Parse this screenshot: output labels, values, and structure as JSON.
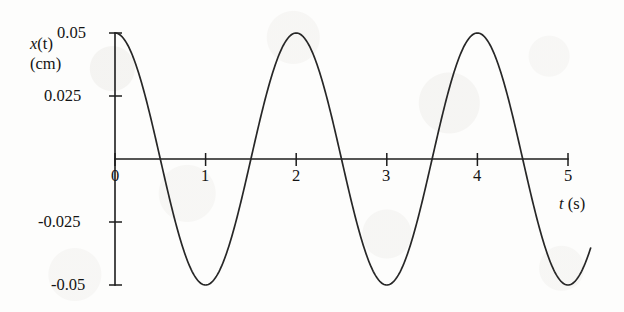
{
  "figure": {
    "background_color": "#fdfdfc",
    "ink_color": "#1c1c1c"
  },
  "axes": {
    "y_axis_label_line1_var": "x",
    "y_axis_label_line1_arg": "(t)",
    "y_axis_label_line2": "(cm)",
    "x_axis_label_var": "t",
    "x_axis_label_unit": "(s)"
  },
  "chart_data": {
    "type": "line",
    "title": "",
    "subtitle": "",
    "xlabel": "t (s)",
    "ylabel": "x(t) (cm)",
    "xlim": [
      0,
      5.25
    ],
    "ylim": [
      -0.05,
      0.05
    ],
    "grid": false,
    "legend": null,
    "x_ticks": [
      0,
      1,
      2,
      3,
      4,
      5
    ],
    "x_tick_labels": [
      "0",
      "1",
      "2",
      "3",
      "4",
      "5"
    ],
    "y_ticks": [
      0.05,
      0.025,
      -0.025,
      -0.05
    ],
    "y_tick_labels": [
      "0.05",
      "0.025",
      "-0.025",
      "-0.05"
    ],
    "function": "x(t) = 0.05 cos(pi t)",
    "amplitude": 0.05,
    "period": 2,
    "units": "cm",
    "series": [
      {
        "name": "x(t)",
        "color": "#272727",
        "x": [
          0,
          0.1,
          0.2,
          0.3,
          0.4,
          0.5,
          0.6,
          0.7,
          0.8,
          0.9,
          1,
          1.1,
          1.2,
          1.3,
          1.4,
          1.5,
          1.6,
          1.7,
          1.8,
          1.9,
          2,
          2.1,
          2.2,
          2.3,
          2.4,
          2.5,
          2.6,
          2.7,
          2.8,
          2.9,
          3,
          3.1,
          3.2,
          3.3,
          3.4,
          3.5,
          3.6,
          3.7,
          3.8,
          3.9,
          4,
          4.1,
          4.2,
          4.3,
          4.4,
          4.5,
          4.6,
          4.7,
          4.8,
          4.9,
          5,
          5.1,
          5.2
        ],
        "y": [
          0.05,
          0.0476,
          0.0405,
          0.0294,
          0.0155,
          0.0,
          -0.0155,
          -0.0294,
          -0.0405,
          -0.0476,
          -0.05,
          -0.0476,
          -0.0405,
          -0.0294,
          -0.0155,
          0.0,
          0.0155,
          0.0294,
          0.0405,
          0.0476,
          0.05,
          0.0476,
          0.0405,
          0.0294,
          0.0155,
          0.0,
          -0.0155,
          -0.0294,
          -0.0405,
          -0.0476,
          -0.05,
          -0.0476,
          -0.0405,
          -0.0294,
          -0.0155,
          0.0,
          0.0155,
          0.0294,
          0.0405,
          0.0476,
          0.05,
          0.0476,
          0.0405,
          0.0294,
          0.0155,
          0.0,
          -0.0155,
          -0.0294,
          -0.0405,
          -0.0476,
          -0.05,
          -0.0476,
          -0.0405
        ]
      }
    ],
    "maxima_at_t": [
      0,
      2,
      4
    ],
    "minima_at_t": [
      1,
      3,
      5
    ],
    "zero_crossings_at_t": [
      0.5,
      1.5,
      2.5,
      3.5,
      4.5
    ]
  }
}
